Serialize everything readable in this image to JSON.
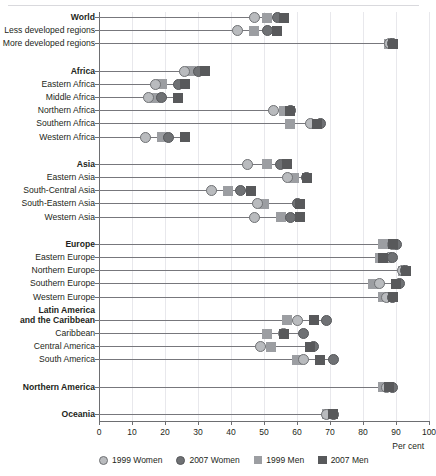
{
  "chart_data": {
    "type": "scatter",
    "title": "",
    "xlabel": "Per cent",
    "ylabel": "",
    "xlim": [
      0,
      100
    ],
    "xticks": [
      0,
      10,
      20,
      30,
      40,
      50,
      60,
      70,
      80,
      90,
      100
    ],
    "grid": true,
    "legend_position": "bottom-left",
    "series": [
      {
        "name": "1999 Women",
        "marker": "circle",
        "color": "#b9bbbe"
      },
      {
        "name": "2007 Women",
        "marker": "circle",
        "color": "#6f7174"
      },
      {
        "name": "1999 Men",
        "marker": "square",
        "color": "#9c9ea2"
      },
      {
        "name": "2007 Men",
        "marker": "square",
        "color": "#58595b"
      }
    ],
    "categories": [
      "World",
      "Less developed regions",
      "More developed regions",
      "Africa",
      "Eastern Africa",
      "Middle Africa",
      "Northern Africa",
      "Southern Africa",
      "Western Africa",
      "Asia",
      "Eastern Asia",
      "South-Central Asia",
      "South-Eastern Asia",
      "Western Asia",
      "Europe",
      "Eastern Europe",
      "Northern Europe",
      "Southern Europe",
      "Western Europe",
      "Latin America and the Caribbean",
      "Caribbean",
      "Central America",
      "South America",
      "Northern America",
      "Oceania"
    ],
    "rows": [
      {
        "label": "World",
        "bold": true,
        "gap_before": 0,
        "values": {
          "1999 Women": 47,
          "2007 Women": 54,
          "1999 Men": 51,
          "2007 Men": 56
        }
      },
      {
        "label": "Less developed regions",
        "bold": false,
        "gap_before": 0,
        "values": {
          "1999 Women": 42,
          "2007 Women": 51,
          "1999 Men": 47,
          "2007 Men": 54
        }
      },
      {
        "label": "More developed regions",
        "bold": false,
        "gap_before": 0,
        "values": {
          "1999 Women": 88,
          "2007 Women": 89,
          "1999 Men": 88,
          "2007 Men": 89
        }
      },
      {
        "label": "Africa",
        "bold": true,
        "gap_before": 14,
        "values": {
          "1999 Women": 26,
          "2007 Women": 30,
          "1999 Men": 28,
          "2007 Men": 32
        }
      },
      {
        "label": "Eastern Africa",
        "bold": false,
        "gap_before": 0,
        "values": {
          "1999 Women": 17,
          "2007 Women": 24,
          "1999 Men": 19,
          "2007 Men": 26
        }
      },
      {
        "label": "Middle Africa",
        "bold": false,
        "gap_before": 0,
        "values": {
          "1999 Women": 15,
          "2007 Women": 19,
          "1999 Men": 17,
          "2007 Men": 24
        }
      },
      {
        "label": "Northern Africa",
        "bold": false,
        "gap_before": 0,
        "values": {
          "1999 Women": 53,
          "2007 Women": 58,
          "1999 Men": 56,
          "2007 Men": 58
        }
      },
      {
        "label": "Southern Africa",
        "bold": false,
        "gap_before": 0,
        "values": {
          "1999 Women": 64,
          "2007 Women": 67,
          "1999 Men": 58,
          "2007 Men": 66
        }
      },
      {
        "label": "Western Africa",
        "bold": false,
        "gap_before": 0,
        "values": {
          "1999 Women": 14,
          "2007 Women": 21,
          "1999 Men": 19,
          "2007 Men": 26
        }
      },
      {
        "label": "Asia",
        "bold": true,
        "gap_before": 14,
        "values": {
          "1999 Women": 45,
          "2007 Women": 55,
          "1999 Men": 51,
          "2007 Men": 57
        }
      },
      {
        "label": "Eastern Asia",
        "bold": false,
        "gap_before": 0,
        "values": {
          "1999 Women": 57,
          "2007 Women": 63,
          "1999 Men": 59,
          "2007 Men": 63
        }
      },
      {
        "label": "South-Central Asia",
        "bold": false,
        "gap_before": 0,
        "values": {
          "1999 Women": 34,
          "2007 Women": 43,
          "1999 Men": 39,
          "2007 Men": 46
        }
      },
      {
        "label": "South-Eastern Asia",
        "bold": false,
        "gap_before": 0,
        "values": {
          "1999 Women": 48,
          "2007 Women": 60,
          "1999 Men": 50,
          "2007 Men": 61
        }
      },
      {
        "label": "Western Asia",
        "bold": false,
        "gap_before": 0,
        "values": {
          "1999 Women": 47,
          "2007 Women": 58,
          "1999 Men": 55,
          "2007 Men": 61
        }
      },
      {
        "label": "Europe",
        "bold": true,
        "gap_before": 14,
        "values": {
          "1999 Women": 89,
          "2007 Women": 90,
          "1999 Men": 86,
          "2007 Men": 89
        }
      },
      {
        "label": "Eastern Europe",
        "bold": false,
        "gap_before": 0,
        "values": {
          "1999 Women": 88,
          "2007 Women": 89,
          "1999 Men": 85,
          "2007 Men": 86
        }
      },
      {
        "label": "Northern Europe",
        "bold": false,
        "gap_before": 0,
        "values": {
          "1999 Women": 92,
          "2007 Women": 93,
          "1999 Men": 92,
          "2007 Men": 93
        }
      },
      {
        "label": "Southern Europe",
        "bold": false,
        "gap_before": 0,
        "values": {
          "1999 Women": 85,
          "2007 Women": 91,
          "1999 Men": 83,
          "2007 Men": 90
        }
      },
      {
        "label": "Western Europe",
        "bold": false,
        "gap_before": 0,
        "values": {
          "1999 Women": 87,
          "2007 Women": 89,
          "1999 Men": 86,
          "2007 Men": 89
        }
      },
      {
        "label": "Latin America and the Caribbean",
        "bold": true,
        "gap_before": 10,
        "two_line": true,
        "values": {
          "1999 Women": 60,
          "2007 Women": 69,
          "1999 Men": 57,
          "2007 Men": 65
        }
      },
      {
        "label": "Caribbean",
        "bold": false,
        "gap_before": 0,
        "values": {
          "1999 Women": 56,
          "2007 Women": 62,
          "1999 Men": 51,
          "2007 Men": 56
        }
      },
      {
        "label": "Central America",
        "bold": false,
        "gap_before": 0,
        "values": {
          "1999 Women": 49,
          "2007 Women": 65,
          "1999 Men": 52,
          "2007 Men": 64
        }
      },
      {
        "label": "South America",
        "bold": false,
        "gap_before": 0,
        "values": {
          "1999 Women": 62,
          "2007 Women": 71,
          "1999 Men": 60,
          "2007 Men": 67
        }
      },
      {
        "label": "Northern America",
        "bold": true,
        "gap_before": 14,
        "values": {
          "1999 Women": 87,
          "2007 Women": 89,
          "1999 Men": 86,
          "2007 Men": 88
        }
      },
      {
        "label": "Oceania",
        "bold": true,
        "gap_before": 14,
        "values": {
          "1999 Women": 69,
          "2007 Women": 71,
          "1999 Men": 69,
          "2007 Men": 71
        }
      }
    ]
  },
  "legend": {
    "items": [
      {
        "label": "1999 Women",
        "shape": "circle",
        "fill": "#b9bbbe",
        "stroke": "#6f7174"
      },
      {
        "label": "2007 Women",
        "shape": "circle",
        "fill": "#6f7174",
        "stroke": "#55575a"
      },
      {
        "label": "1999 Men",
        "shape": "square",
        "fill": "#9c9ea2",
        "stroke": "#9c9ea2"
      },
      {
        "label": "2007 Men",
        "shape": "square",
        "fill": "#58595b",
        "stroke": "#58595b"
      }
    ]
  },
  "axis": {
    "title": "Per cent",
    "ticks": [
      "0",
      "10",
      "20",
      "30",
      "40",
      "50",
      "60",
      "70",
      "80",
      "90",
      "100"
    ]
  }
}
